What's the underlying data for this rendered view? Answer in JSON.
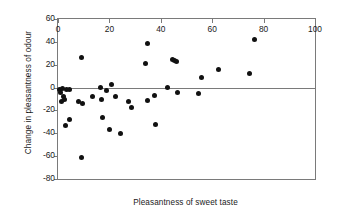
{
  "chart_data": {
    "type": "scatter",
    "title": "",
    "xlabel": "Pleasantness of sweet taste",
    "ylabel": "Change in pleasantness of odour",
    "xlim": [
      0,
      100
    ],
    "ylim": [
      -80,
      60
    ],
    "xticks": [
      0,
      20,
      40,
      60,
      80,
      100
    ],
    "yticks": [
      -80,
      -60,
      -40,
      -20,
      0,
      20,
      40,
      60
    ],
    "xtick_labels": [
      "0",
      "20",
      "40",
      "60",
      "80",
      "100"
    ],
    "ytick_labels": [
      "-80",
      "-60",
      "-40",
      "-20",
      "0",
      "20",
      "40",
      "60"
    ],
    "grid": false,
    "legend": null,
    "reference_lines": [
      {
        "orientation": "horizontal",
        "value": 0,
        "color": "#7a7a7a"
      }
    ],
    "marker": {
      "shape": "circle",
      "color": "#111111",
      "size": 5
    },
    "points": [
      {
        "x": 0.6,
        "y": -1.5
      },
      {
        "x": 1.0,
        "y": -4.0
      },
      {
        "x": 1.4,
        "y": -12.5
      },
      {
        "x": 1.8,
        "y": -1.0
      },
      {
        "x": 2.2,
        "y": -8.0
      },
      {
        "x": 2.6,
        "y": -10.5
      },
      {
        "x": 3.0,
        "y": -33.0
      },
      {
        "x": 3.4,
        "y": -2.0
      },
      {
        "x": 4.4,
        "y": -2.0
      },
      {
        "x": 4.6,
        "y": -27.5
      },
      {
        "x": 8.0,
        "y": -12.5
      },
      {
        "x": 9.0,
        "y": 26.5
      },
      {
        "x": 9.2,
        "y": -61.5
      },
      {
        "x": 9.6,
        "y": -13.5
      },
      {
        "x": 13.5,
        "y": -7.5
      },
      {
        "x": 16.5,
        "y": 0.5
      },
      {
        "x": 17.0,
        "y": -10.5
      },
      {
        "x": 17.3,
        "y": -26.5
      },
      {
        "x": 19.0,
        "y": -2.5
      },
      {
        "x": 20.0,
        "y": -37.0
      },
      {
        "x": 21.0,
        "y": 3.0
      },
      {
        "x": 22.5,
        "y": -7.5
      },
      {
        "x": 24.5,
        "y": -40.0
      },
      {
        "x": 27.5,
        "y": -12.0
      },
      {
        "x": 28.5,
        "y": -17.5
      },
      {
        "x": 34.0,
        "y": 21.0
      },
      {
        "x": 34.8,
        "y": 38.5
      },
      {
        "x": 35.0,
        "y": -11.5
      },
      {
        "x": 37.5,
        "y": -6.5
      },
      {
        "x": 38.0,
        "y": -32.5
      },
      {
        "x": 42.5,
        "y": 0.0
      },
      {
        "x": 44.5,
        "y": 24.5
      },
      {
        "x": 45.3,
        "y": 24.0
      },
      {
        "x": 46.0,
        "y": 23.0
      },
      {
        "x": 46.5,
        "y": -4.5
      },
      {
        "x": 54.5,
        "y": -5.5
      },
      {
        "x": 56.0,
        "y": 9.0
      },
      {
        "x": 62.5,
        "y": 15.5
      },
      {
        "x": 74.5,
        "y": 12.0
      },
      {
        "x": 76.5,
        "y": 42.5
      }
    ]
  }
}
